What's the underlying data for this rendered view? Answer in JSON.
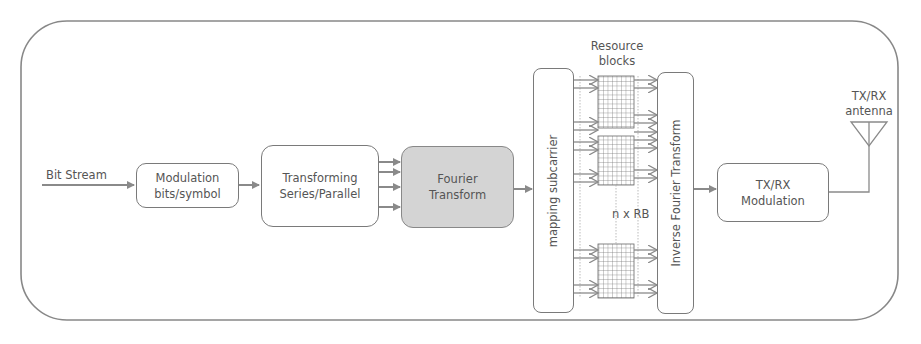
{
  "diagram": {
    "input_label": "Bit Stream",
    "blocks": [
      {
        "id": "modulation",
        "lines": [
          "Modulation",
          "bits/symbol"
        ],
        "highlighted": false
      },
      {
        "id": "serial-parallel",
        "lines": [
          "Transforming",
          "Series/Parallel"
        ],
        "highlighted": false
      },
      {
        "id": "fourier",
        "lines": [
          "Fourier",
          "Transform"
        ],
        "highlighted": true
      },
      {
        "id": "mapping",
        "lines": [
          "mapping subcarrier"
        ],
        "orientation": "vertical"
      },
      {
        "id": "ifft",
        "lines": [
          "Inverse Fourier Transform"
        ],
        "orientation": "vertical"
      },
      {
        "id": "txrx-mod",
        "lines": [
          "TX/RX",
          "Modulation"
        ],
        "highlighted": false
      }
    ],
    "resource_blocks_label": [
      "Resource",
      "blocks"
    ],
    "n_rb_label": "n x RB",
    "antenna_label": [
      "TX/RX",
      "antenna"
    ],
    "parallel_arrow_count": 4,
    "resource_block_count_shown": 3,
    "colors": {
      "line": "#8a8a8a",
      "box_border": "#7a7a7a",
      "highlight_fill": "#d4d4d4",
      "text": "#555555"
    }
  }
}
